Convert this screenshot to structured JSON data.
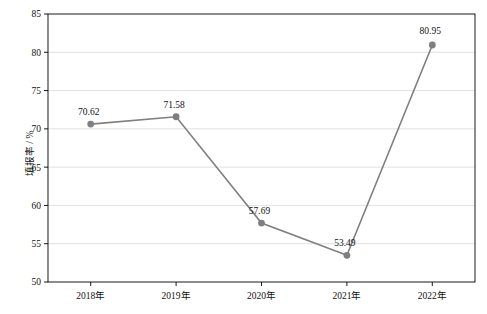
{
  "chart_data": {
    "type": "line",
    "title": "",
    "xlabel": "",
    "ylabel": "填报率 / %",
    "categories": [
      "2018年",
      "2019年",
      "2020年",
      "2021年",
      "2022年"
    ],
    "values": [
      70.62,
      71.58,
      57.69,
      53.49,
      80.95
    ],
    "point_labels": [
      "70.62",
      "71.58",
      "57.69",
      "53.49",
      "80.95"
    ],
    "ylim": [
      50,
      85
    ],
    "yticks": [
      50,
      55,
      60,
      65,
      70,
      75,
      80,
      85
    ],
    "ytick_labels": [
      "50",
      "55",
      "60",
      "65",
      "70",
      "75",
      "80",
      "85"
    ],
    "grid": "horizontal",
    "legend": "none",
    "series_color": "#7f7f7f",
    "marker": "circle",
    "axis_color": "#000000",
    "grid_color": "#d9d9d9"
  }
}
